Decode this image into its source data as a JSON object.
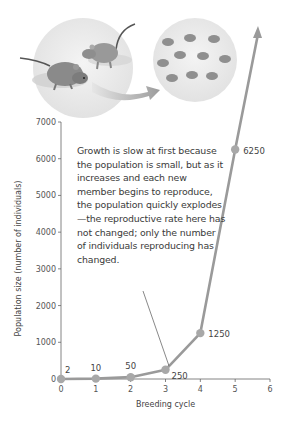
{
  "chart_data": {
    "type": "line",
    "title": "",
    "xlabel": "Breeding cycle",
    "ylabel": "Population size (number of individuals)",
    "x": [
      0,
      1,
      2,
      3,
      4,
      5
    ],
    "values": [
      2,
      10,
      50,
      250,
      1250,
      6250
    ],
    "data_labels": [
      "2",
      "10",
      "50",
      "250",
      "1250",
      "6250"
    ],
    "xlim": [
      0,
      6
    ],
    "ylim": [
      0,
      7000
    ],
    "x_ticks": [
      "0",
      "1",
      "2",
      "3",
      "4",
      "5",
      "6"
    ],
    "y_ticks": [
      "0",
      "1000",
      "2000",
      "3000",
      "4000",
      "5000",
      "6000",
      "7000"
    ],
    "grid": false,
    "legend": null,
    "line_continues_with_arrow": true,
    "annotation": "Growth is slow at first because the population is small, but as it increases and each new member begins to reproduce, the  population quickly explodes—the reproductive rate here has not changed; only the number of individuals reproducing has changed.",
    "annotation_points_to_x": 3.1,
    "illustration": "two mice on left reproducing into many mice on right (circle with arrow)",
    "colors": {
      "line": "#9a9a9a",
      "points": "#a8a8a8",
      "axis": "#666666",
      "text": "#3a3a3a"
    }
  }
}
